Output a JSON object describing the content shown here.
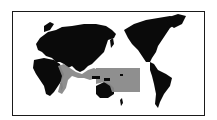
{
  "map": {
    "projection": "pacific-centered-world",
    "colors": {
      "background": "#ffffff",
      "land": "#0a0a0a",
      "range": "#8a8a8a",
      "frame": "#1a1a1a"
    },
    "legend": null,
    "regions": [
      {
        "name": "distribution-range",
        "description": "Indian Ocean coasts, Southeast Asia, Indonesia, northern Australia, western Pacific"
      }
    ]
  }
}
